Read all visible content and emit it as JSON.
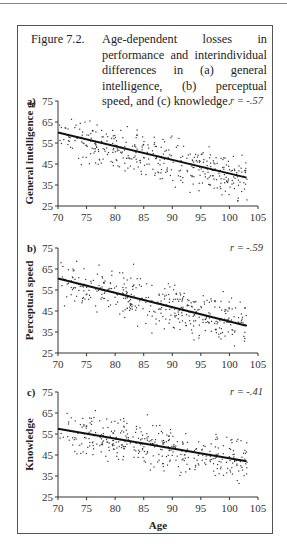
{
  "caption": {
    "label": "Figure 7.2.",
    "text": "Age-dependent losses in performance and interindividual differences in (a) general intelligence, (b) perceptual speed, and (c) knowledge."
  },
  "chart_data": [
    {
      "type": "scatter",
      "panel": "a)",
      "ylabel": "General intelligence g",
      "xlabel": "",
      "annotation": "r = -.57",
      "xticks": [
        70,
        75,
        80,
        85,
        90,
        95,
        100,
        105
      ],
      "yticks": [
        25,
        35,
        45,
        55,
        65,
        75
      ],
      "xlim": [
        70,
        105
      ],
      "ylim": [
        25,
        75
      ],
      "regression": {
        "x": [
          70,
          103
        ],
        "y": [
          60,
          38.5
        ]
      }
    },
    {
      "type": "scatter",
      "panel": "b)",
      "ylabel": "Perceptual speed",
      "xlabel": "",
      "annotation": "r = -.59",
      "xticks": [
        70,
        75,
        80,
        85,
        90,
        95,
        100,
        105
      ],
      "yticks": [
        25,
        35,
        45,
        55,
        65,
        75
      ],
      "xlim": [
        70,
        105
      ],
      "ylim": [
        25,
        75
      ],
      "regression": {
        "x": [
          70,
          103
        ],
        "y": [
          60.5,
          38
        ]
      }
    },
    {
      "type": "scatter",
      "panel": "c)",
      "ylabel": "Knowledge",
      "xlabel": "Age",
      "annotation": "r = -.41",
      "xticks": [
        70,
        75,
        80,
        85,
        90,
        95,
        100,
        105
      ],
      "yticks": [
        25,
        35,
        45,
        55,
        65,
        75
      ],
      "xlim": [
        70,
        105
      ],
      "ylim": [
        25,
        75
      ],
      "regression": {
        "x": [
          70,
          103
        ],
        "y": [
          57.5,
          42
        ]
      }
    }
  ]
}
